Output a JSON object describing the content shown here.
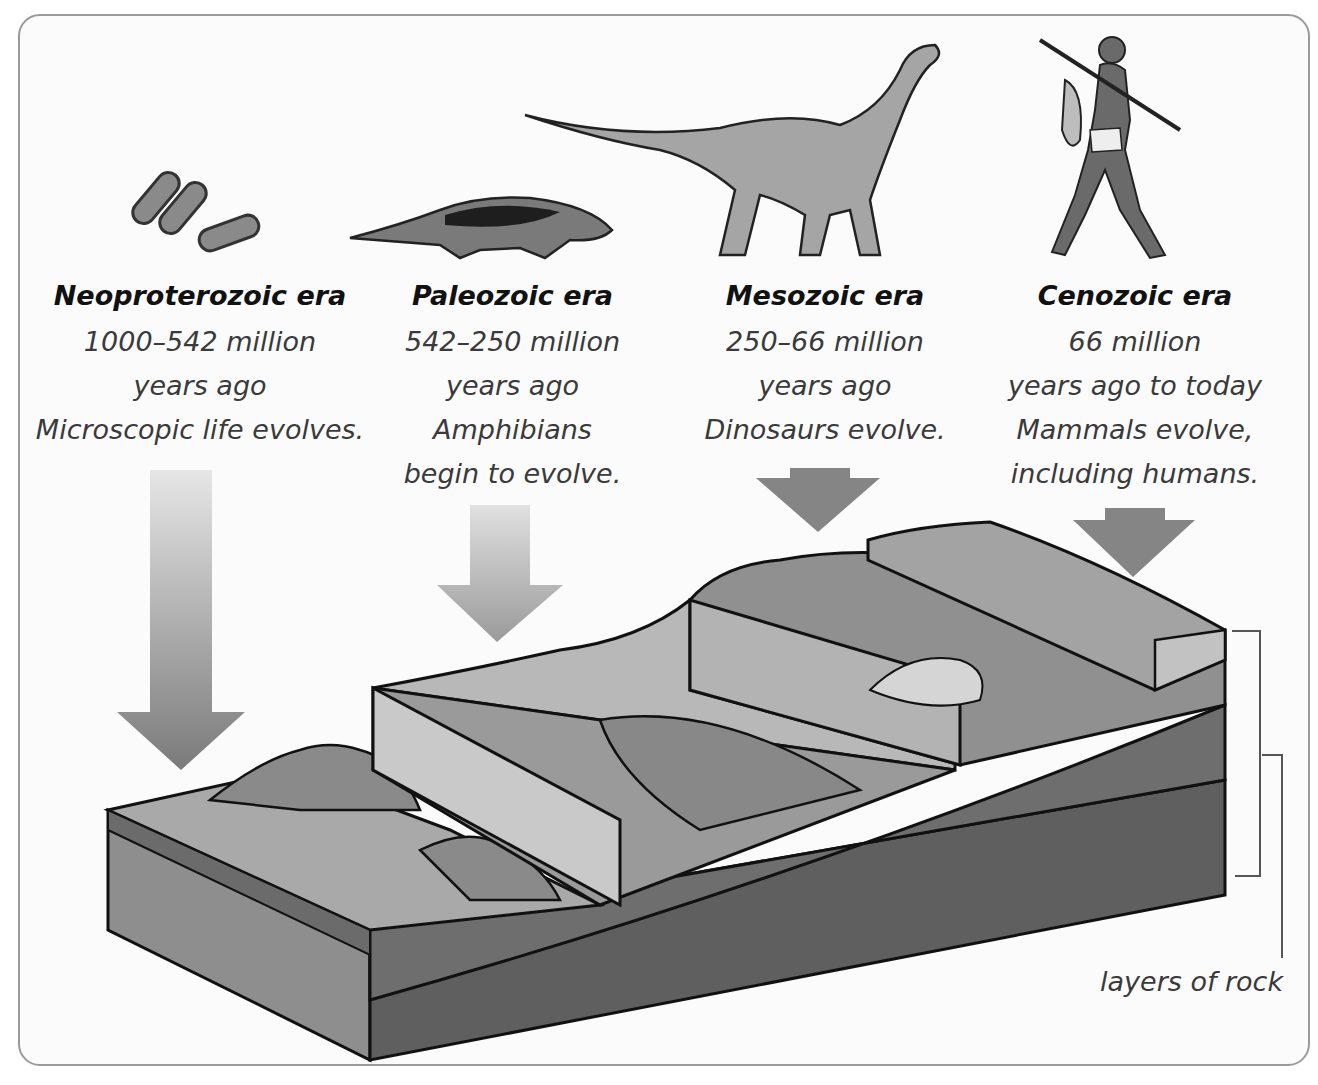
{
  "diagram": {
    "eras": [
      {
        "name": "Neoproterozoic era",
        "range_line1": "1000–542 million",
        "range_line2": "years ago",
        "desc_line1": "Microscopic life evolves.",
        "desc_line2": "",
        "organism_icon": "bacteria-icon"
      },
      {
        "name": "Paleozoic era",
        "range_line1": "542–250 million",
        "range_line2": "years ago",
        "desc_line1": "Amphibians",
        "desc_line2": "begin to evolve.",
        "organism_icon": "amphibian-icon"
      },
      {
        "name": "Mesozoic era",
        "range_line1": "250–66 million",
        "range_line2": "years ago",
        "desc_line1": "Dinosaurs evolve.",
        "desc_line2": "",
        "organism_icon": "dinosaur-icon"
      },
      {
        "name": "Cenozoic era",
        "range_line1": "66 million",
        "range_line2": "years ago to today",
        "desc_line1": "Mammals evolve,",
        "desc_line2": "including humans.",
        "organism_icon": "human-icon"
      }
    ],
    "label": "layers of rock",
    "colors": {
      "text_dark": "#111111",
      "text_gray": "#3a3a3a",
      "rock_light": "#bdbdbd",
      "rock_mid": "#8c8c8c",
      "rock_dark": "#5e5e5e",
      "arrow": "#8a8a8a",
      "frame": "#9a9a9a"
    }
  }
}
